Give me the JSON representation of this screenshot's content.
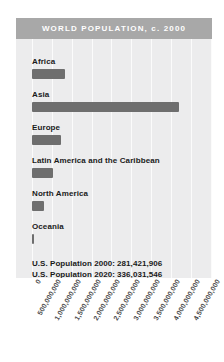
{
  "chart_data": {
    "type": "bar",
    "orientation": "horizontal",
    "title": "WORLD POPULATION, c. 2000",
    "categories": [
      "Africa",
      "Asia",
      "Europe",
      "Latin America and the Caribbean",
      "North America",
      "Oceania"
    ],
    "values": [
      820000000,
      3700000000,
      727000000,
      520000000,
      314000000,
      31000000
    ],
    "xlabel": "",
    "ylabel": "",
    "xlim": [
      0,
      4500000000
    ],
    "tick_labels": [
      "0",
      "500,000,000",
      "1,000,000,000",
      "1,500,000,000",
      "2,000,000,000",
      "2,500,000,000",
      "3,000,000,000",
      "3,500,000,000",
      "4,000,000,000",
      "4,500,000,000"
    ],
    "tick_values": [
      0,
      500000000,
      1000000000,
      1500000000,
      2000000000,
      2500000000,
      3000000000,
      3500000000,
      4000000000,
      4500000000
    ],
    "grid": true,
    "legend": "none",
    "annotations": [
      "U.S. Population 2000: 281,421,906",
      "U.S. Population 2020: 336,031,546"
    ],
    "colors": {
      "bar": "#6e6e6e",
      "panel": "#ececed",
      "title_bar": "#a8a8a8",
      "title_text": "#ffffff",
      "gridline": "#fbfbfb",
      "label_text": "#1a1a1a",
      "tick_text": "#4a4a4a"
    }
  }
}
